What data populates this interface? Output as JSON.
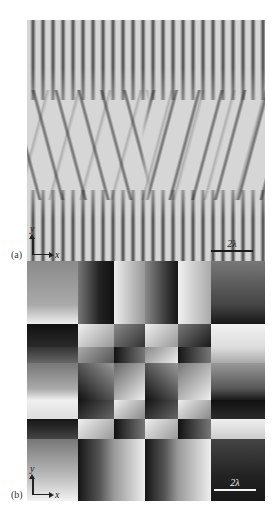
{
  "figure": {
    "panels": [
      {
        "id": "a",
        "label": "(a)",
        "description": "interference fringe pattern (grayscale)",
        "axes": {
          "y_label": "y",
          "x_label": "x"
        },
        "scale_bar": {
          "label": "2λ"
        }
      },
      {
        "id": "b",
        "label": "(b)",
        "description": "phase distribution with vortex lattice (grayscale)",
        "axes": {
          "y_label": "y",
          "x_label": "x"
        },
        "scale_bar": {
          "label": "2λ"
        }
      }
    ]
  },
  "colors": {
    "fringe_background": "#d6d6d6",
    "fringe_dark": "#1e1e1e",
    "phase_black": "#111111",
    "phase_white": "#f2f2f2",
    "scale_bar_a": "#1a1a1a",
    "scale_bar_b": "#f4f4f4"
  }
}
